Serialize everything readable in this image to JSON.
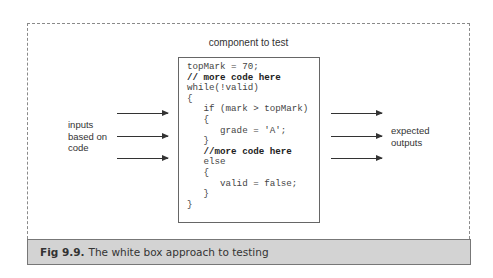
{
  "diagram": {
    "component_label": "component to test",
    "code_lines": [
      {
        "text": "topMark = 70;",
        "bold": false
      },
      {
        "text": "// more code here",
        "bold": true
      },
      {
        "text": "while(!valid)",
        "bold": false
      },
      {
        "text": "{",
        "bold": false
      },
      {
        "text": "   if (mark > topMark)",
        "bold": false
      },
      {
        "text": "   {",
        "bold": false
      },
      {
        "text": "      grade = 'A';",
        "bold": false
      },
      {
        "text": "   }",
        "bold": false
      },
      {
        "text": "   //more code here",
        "bold": true
      },
      {
        "text": "   else",
        "bold": false
      },
      {
        "text": "   {",
        "bold": false
      },
      {
        "text": "      valid = false;",
        "bold": false
      },
      {
        "text": "   }",
        "bold": false
      },
      {
        "text": "}",
        "bold": false
      }
    ],
    "inputs_label": [
      "inputs",
      "based on",
      "code"
    ],
    "outputs_label": [
      "expected",
      "outputs"
    ],
    "input_arrow_count": 3,
    "output_arrow_count": 3
  },
  "caption": {
    "figure_number": "Fig 9.9.",
    "text": "The white box approach to testing"
  },
  "colors": {
    "caption_background": "#d3d3d3",
    "border": "#777777",
    "text": "#333333"
  }
}
